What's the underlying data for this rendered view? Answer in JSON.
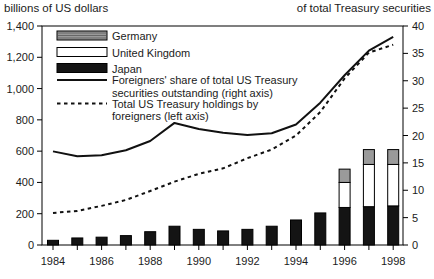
{
  "chart_data": {
    "type": "bar-line-combo",
    "title": "",
    "grid": false,
    "categories": [
      1984,
      1985,
      1986,
      1987,
      1988,
      1989,
      1990,
      1991,
      1992,
      1993,
      1994,
      1995,
      1996,
      1997,
      1998
    ],
    "x_axis": {
      "tick_labels": [
        "1984",
        "1986",
        "1988",
        "1990",
        "1992",
        "1994",
        "1996",
        "1998"
      ]
    },
    "left_axis": {
      "title": "billions of US dollars",
      "range": [
        0,
        1400
      ],
      "tick_values": [
        0,
        200,
        400,
        600,
        800,
        1000,
        1200,
        1400
      ],
      "tick_labels": [
        "0",
        "200",
        "400",
        "600",
        "800",
        "1,000",
        "1,200",
        "1,400"
      ]
    },
    "right_axis": {
      "title": "of total Treasury securities",
      "range": [
        0,
        40
      ],
      "tick_values": [
        0,
        5,
        10,
        15,
        20,
        25,
        30,
        35,
        40
      ],
      "tick_labels": [
        "0",
        "5",
        "10",
        "15",
        "20",
        "25",
        "30",
        "35",
        "40"
      ]
    },
    "series": [
      {
        "name": "Japan",
        "type": "bar",
        "stack": "holdings",
        "axis": "left",
        "color": "#141414",
        "values": [
          30,
          45,
          50,
          60,
          85,
          120,
          100,
          90,
          100,
          120,
          160,
          205,
          240,
          245,
          250
        ]
      },
      {
        "name": "United Kingdom",
        "type": "bar",
        "stack": "holdings",
        "axis": "left",
        "color": "#ffffff",
        "values": [
          0,
          0,
          0,
          0,
          0,
          0,
          0,
          0,
          0,
          0,
          0,
          0,
          160,
          270,
          265
        ]
      },
      {
        "name": "Germany",
        "type": "bar",
        "stack": "holdings",
        "axis": "left",
        "color": "#9a9a9a",
        "values": [
          0,
          0,
          0,
          0,
          0,
          0,
          0,
          0,
          0,
          0,
          0,
          0,
          85,
          95,
          95
        ]
      },
      {
        "name": "Foreigners' share of total US Treasury securities outstanding",
        "type": "line",
        "style": "solid",
        "axis": "right",
        "color": "#111111",
        "values": [
          17.1,
          16.2,
          16.4,
          17.3,
          19,
          22.3,
          21.2,
          20.5,
          20.1,
          20.4,
          22,
          26,
          31,
          35.5,
          38
        ]
      },
      {
        "name": "Total US Treasury holdings by foreigners",
        "type": "line",
        "style": "dashed",
        "axis": "left",
        "color": "#111111",
        "values": [
          205,
          218,
          250,
          288,
          345,
          405,
          455,
          490,
          555,
          610,
          700,
          850,
          1065,
          1230,
          1280
        ]
      }
    ],
    "legend": {
      "position": "top-left-inside",
      "entries": [
        {
          "swatch": "bar-germany",
          "label_lines": [
            "Germany"
          ]
        },
        {
          "swatch": "bar-united-kingdom",
          "label_lines": [
            "United Kingdom"
          ]
        },
        {
          "swatch": "bar-japan",
          "label_lines": [
            "Japan"
          ]
        },
        {
          "swatch": "line-solid",
          "label_lines": [
            "Foreigners' share of total US Treasury",
            "securities outstanding (right axis)"
          ]
        },
        {
          "swatch": "line-dashed",
          "label_lines": [
            "Total US Treasury holdings by",
            "foreigners (left axis)"
          ]
        }
      ]
    }
  },
  "colors": {
    "background": "#ffffff",
    "frame": "#000000",
    "text": "#1b1b1b"
  }
}
